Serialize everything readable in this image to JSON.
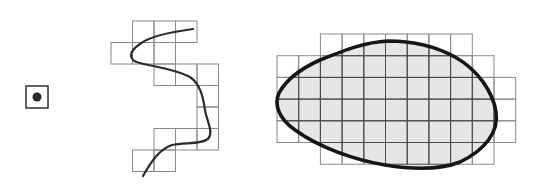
{
  "diagram": {
    "colors": {
      "background": "#ffffff",
      "grid_outer": "#8a8a8a",
      "grid_inner": "#4a4a4a",
      "polygon_fill": "#e6e6e6",
      "outline": "#161616",
      "line": "#2b2b2b",
      "point": "#2a2a2a"
    },
    "point": {
      "cell": {
        "x": 26,
        "y": 86,
        "size": 22
      },
      "dot": {
        "cx": 37,
        "cy": 97,
        "r": 4.5
      }
    },
    "line": {
      "grid": {
        "x0": 111,
        "y0": 21,
        "cell": 21.5
      },
      "cells": [
        [
          0,
          1
        ],
        [
          0,
          2
        ],
        [
          0,
          3
        ],
        [
          1,
          0
        ],
        [
          1,
          1
        ],
        [
          1,
          2
        ],
        [
          2,
          2
        ],
        [
          2,
          3
        ],
        [
          2,
          4
        ],
        [
          3,
          4
        ],
        [
          4,
          4
        ],
        [
          5,
          2
        ],
        [
          5,
          3
        ],
        [
          5,
          4
        ],
        [
          6,
          1
        ],
        [
          6,
          2
        ]
      ],
      "path": "M193,29 C170,32 150,36 140,44 C128,52 128,60 140,63 C155,67 175,69 190,77 C200,84 203,96 205,110 C207,122 214,132 208,139 C200,145 184,142 172,145 C160,149 152,160 143,176"
    },
    "polygon": {
      "grid": {
        "x0": 277,
        "y0": 34,
        "cell": 21.7
      },
      "rows": [
        {
          "row": 0,
          "from": 2,
          "to": 8
        },
        {
          "row": 1,
          "from": 0,
          "to": 9
        },
        {
          "row": 2,
          "from": 0,
          "to": 10
        },
        {
          "row": 3,
          "from": 0,
          "to": 10
        },
        {
          "row": 4,
          "from": 0,
          "to": 10
        },
        {
          "row": 5,
          "from": 2,
          "to": 9
        }
      ],
      "path": "M388,41 C410,41 435,46 455,57 C478,70 493,92 496,112 C499,132 485,150 460,162 C440,170 410,169 385,165 C355,160 320,148 295,130 C278,118 274,104 279,93 C286,80 300,69 320,60 C345,50 365,42 388,41 Z"
    }
  }
}
